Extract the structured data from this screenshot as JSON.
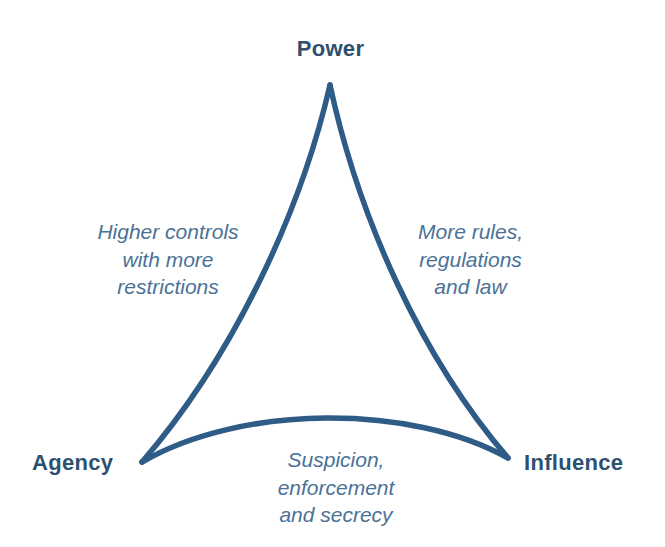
{
  "diagram": {
    "type": "curved-triangle",
    "background_color": "#ffffff",
    "stroke_color": "#2e5c87",
    "vertex_label_color": "#2d5070",
    "note_color": "#4a7296",
    "vertices": [
      {
        "id": "power",
        "label": "Power",
        "position": "top"
      },
      {
        "id": "agency",
        "label": "Agency",
        "position": "bottom-left"
      },
      {
        "id": "influence",
        "label": "Influence",
        "position": "bottom-right"
      }
    ],
    "edges": [
      {
        "id": "left",
        "between": "Power – Agency",
        "lines": [
          "Higher controls",
          "with more",
          "restrictions"
        ]
      },
      {
        "id": "right",
        "between": "Power – Influence",
        "lines": [
          "More rules,",
          "regulations",
          "and law"
        ]
      },
      {
        "id": "bottom",
        "between": "Agency – Influence",
        "lines": [
          "Suspicion,",
          "enforcement",
          "and secrecy"
        ]
      }
    ]
  }
}
